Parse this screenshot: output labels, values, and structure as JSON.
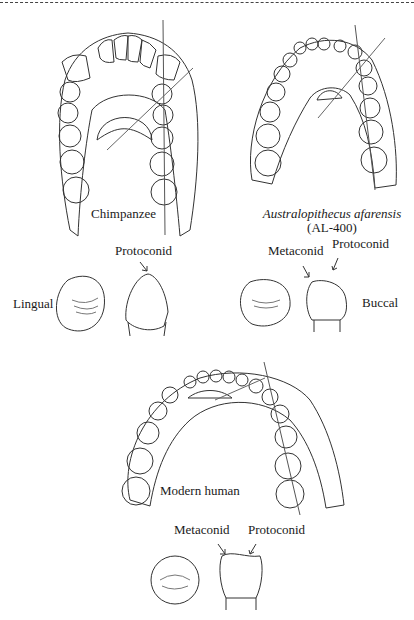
{
  "figure": {
    "panels": [
      {
        "name": "Chimpanzee",
        "label": "Chimpanzee"
      },
      {
        "name": "Australopithecus afarensis",
        "label": "Australopithecus afarensis",
        "sublabel": "(AL-400)"
      },
      {
        "name": "Modern human",
        "label": "Modern human"
      }
    ],
    "tooth_labels": {
      "lingual": "Lingual",
      "buccal": "Buccal",
      "chimp_protoconid": "Protoconid",
      "afar_metaconid": "Metaconid",
      "afar_protoconid": "Protoconid",
      "human_metaconid": "Metaconid",
      "human_protoconid": "Protoconid"
    }
  }
}
